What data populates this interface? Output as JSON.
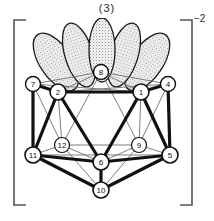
{
  "figure": {
    "label": "(3)",
    "charge": "−2",
    "bracket_left": "[",
    "bracket_right": "]",
    "caption_text": "(3)"
  },
  "colors": {
    "background": "#ffffff",
    "outline": "#111111",
    "bold_edge": "#111111",
    "thin_edge": "#5a5a5a",
    "hidden_edge": "#8d8d8d",
    "lobe_fill": "#f2f2f0",
    "lobe_stipple": "#7d7d7d",
    "lobe_outline": "#1a1a1a",
    "vertex_fill": "#ffffff",
    "text": "#111111",
    "bracket": "#555555"
  },
  "cluster": {
    "vertex_radius": 7.5,
    "vertices": [
      {
        "id": "1",
        "label": "1",
        "x": 141,
        "y": 92,
        "kind": "front-upper"
      },
      {
        "id": "2",
        "label": "2",
        "x": 58,
        "y": 92,
        "kind": "front-upper"
      },
      {
        "id": "4",
        "label": "4",
        "x": 168,
        "y": 84,
        "kind": "rear-upper"
      },
      {
        "id": "5",
        "label": "5",
        "x": 170,
        "y": 155,
        "kind": "front-lower"
      },
      {
        "id": "6",
        "label": "6",
        "x": 101,
        "y": 162,
        "kind": "front-lower"
      },
      {
        "id": "7",
        "label": "7",
        "x": 33,
        "y": 84,
        "kind": "rear-upper"
      },
      {
        "id": "8",
        "label": "8",
        "x": 101,
        "y": 72,
        "kind": "top-apex"
      },
      {
        "id": "9",
        "label": "9",
        "x": 139,
        "y": 145,
        "kind": "hidden-mid"
      },
      {
        "id": "10",
        "label": "10",
        "x": 101,
        "y": 190,
        "kind": "bottom-apex"
      },
      {
        "id": "11",
        "label": "11",
        "x": 33,
        "y": 155,
        "kind": "front-lower"
      },
      {
        "id": "12",
        "label": "12",
        "x": 62,
        "y": 145,
        "kind": "hidden-mid"
      }
    ],
    "edges_bold": [
      [
        "2",
        "1"
      ],
      [
        "2",
        "7"
      ],
      [
        "1",
        "4"
      ],
      [
        "2",
        "6"
      ],
      [
        "1",
        "6"
      ],
      [
        "2",
        "11"
      ],
      [
        "1",
        "5"
      ],
      [
        "11",
        "6"
      ],
      [
        "6",
        "5"
      ],
      [
        "11",
        "6"
      ],
      [
        "7",
        "11"
      ],
      [
        "4",
        "5"
      ],
      [
        "6",
        "10"
      ],
      [
        "11",
        "10"
      ],
      [
        "5",
        "10"
      ],
      [
        "7",
        "2"
      ],
      [
        "4",
        "1"
      ]
    ],
    "edges_thin": [
      [
        "7",
        "8"
      ],
      [
        "8",
        "4"
      ],
      [
        "8",
        "1"
      ],
      [
        "8",
        "2"
      ],
      [
        "8",
        "12"
      ],
      [
        "8",
        "9"
      ],
      [
        "2",
        "12"
      ],
      [
        "12",
        "11"
      ],
      [
        "12",
        "6"
      ],
      [
        "12",
        "9"
      ],
      [
        "1",
        "9"
      ],
      [
        "9",
        "5"
      ],
      [
        "9",
        "6"
      ],
      [
        "7",
        "12"
      ],
      [
        "4",
        "9"
      ],
      [
        "11",
        "12"
      ],
      [
        "5",
        "9"
      ],
      [
        "7",
        "1"
      ],
      [
        "2",
        "4"
      ],
      [
        "11",
        "5"
      ],
      [
        "10",
        "12"
      ],
      [
        "10",
        "9"
      ]
    ],
    "lobes": [
      {
        "id": "lobe-1",
        "cx": 56,
        "cy": 62,
        "rx": 16,
        "ry": 33,
        "rot": -34
      },
      {
        "id": "lobe-2",
        "cx": 79,
        "cy": 55,
        "rx": 14,
        "ry": 33,
        "rot": -17
      },
      {
        "id": "lobe-3",
        "cx": 102,
        "cy": 50,
        "rx": 13,
        "ry": 32,
        "rot": 0
      },
      {
        "id": "lobe-4",
        "cx": 124,
        "cy": 55,
        "rx": 14,
        "ry": 33,
        "rot": 17
      },
      {
        "id": "lobe-5",
        "cx": 147,
        "cy": 62,
        "rx": 16,
        "ry": 33,
        "rot": 34
      }
    ]
  }
}
